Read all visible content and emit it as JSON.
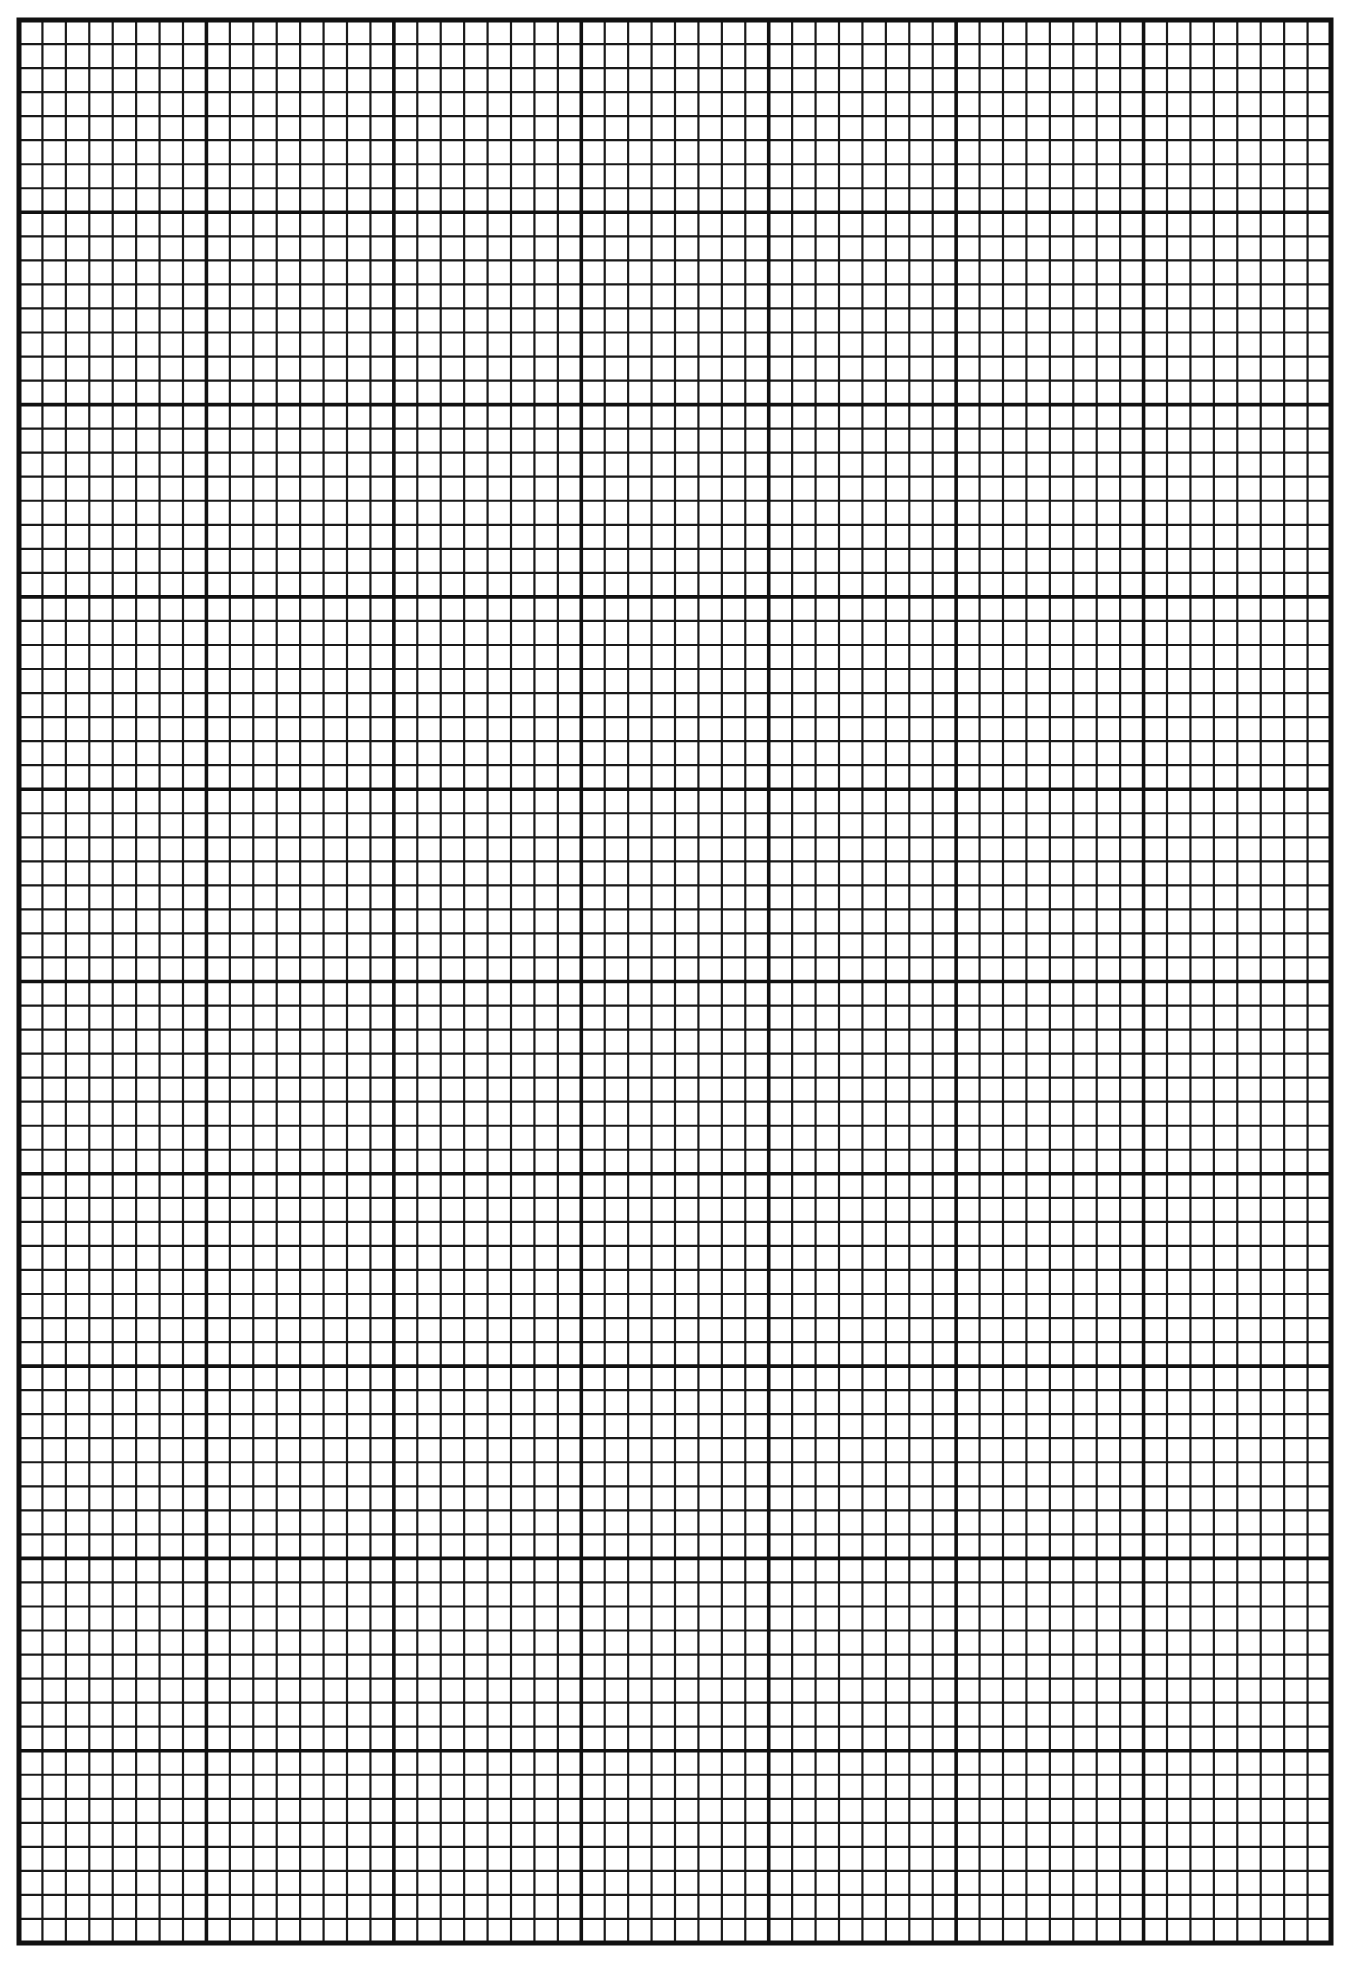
{
  "page": {
    "width": 1351,
    "height": 1966,
    "background": "#ffffff"
  },
  "grid": {
    "left": 19,
    "top": 20,
    "right": 1331,
    "bottom": 1943,
    "major_columns": 7,
    "major_rows": 10,
    "minor_per_major": 8,
    "line_color": "#111111",
    "minor_line_width": 2.2,
    "major_line_width": 3.6,
    "border_width": 5
  }
}
